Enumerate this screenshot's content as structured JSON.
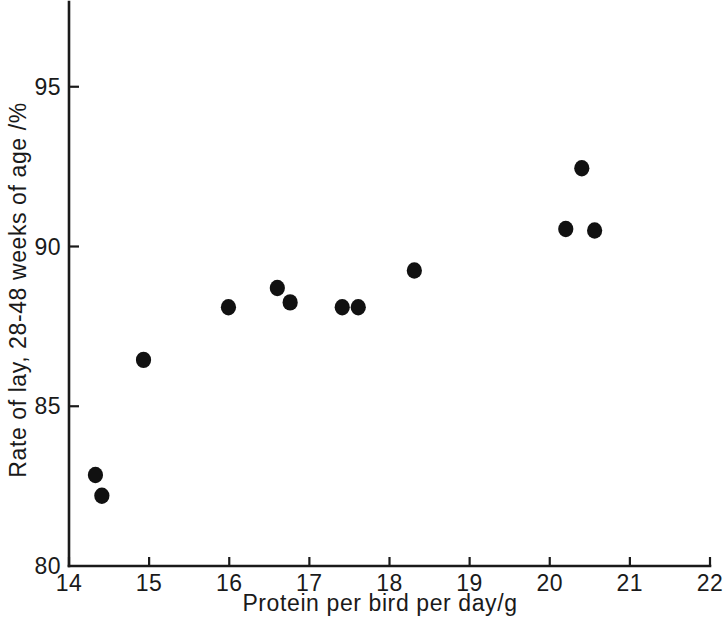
{
  "chart_data": {
    "type": "scatter",
    "title": "",
    "xlabel": "Protein per bird per day/g",
    "ylabel": "Rate of lay, 28-48 weeks of age /%",
    "xlim": [
      14,
      22
    ],
    "ylim": [
      80,
      97.7
    ],
    "xticks": [
      14,
      15,
      16,
      17,
      18,
      19,
      20,
      21,
      22
    ],
    "xtick_labels": [
      "14",
      "15",
      "16",
      "17",
      "18",
      "19",
      "20",
      "21",
      "22"
    ],
    "yticks": [
      80,
      85,
      90,
      95
    ],
    "ytick_labels": [
      "80",
      "85",
      "90",
      "95"
    ],
    "grid": false,
    "legend": null,
    "marker": "filled-circle",
    "marker_color": "#111111",
    "points": [
      {
        "x": 14.33,
        "y": 82.85
      },
      {
        "x": 14.41,
        "y": 82.2
      },
      {
        "x": 14.93,
        "y": 86.45
      },
      {
        "x": 15.99,
        "y": 88.1
      },
      {
        "x": 16.6,
        "y": 88.7
      },
      {
        "x": 16.76,
        "y": 88.25
      },
      {
        "x": 17.41,
        "y": 88.1
      },
      {
        "x": 17.61,
        "y": 88.1
      },
      {
        "x": 18.31,
        "y": 89.25
      },
      {
        "x": 20.2,
        "y": 90.55
      },
      {
        "x": 20.4,
        "y": 92.45
      },
      {
        "x": 20.56,
        "y": 90.5
      }
    ]
  },
  "axes": {
    "x_axis_name": "x-axis",
    "y_axis_name": "y-axis"
  }
}
